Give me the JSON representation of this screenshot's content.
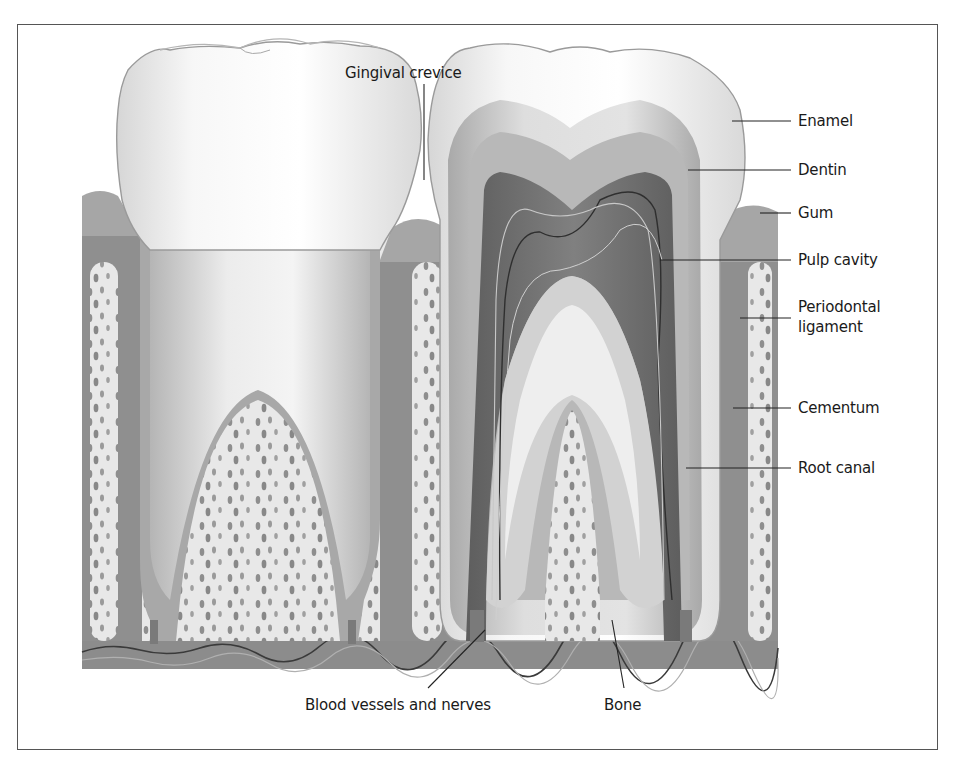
{
  "figure": {
    "title_label": "Gingival crevice",
    "right_labels": [
      {
        "id": "enamel",
        "text": "Enamel"
      },
      {
        "id": "dentin",
        "text": "Dentin"
      },
      {
        "id": "gum",
        "text": "Gum"
      },
      {
        "id": "pulp-cavity",
        "text": "Pulp cavity"
      },
      {
        "id": "periodontal-ligament",
        "text": "Periodontal",
        "text2": "ligament"
      },
      {
        "id": "cementum",
        "text": "Cementum"
      },
      {
        "id": "root-canal",
        "text": "Root canal"
      }
    ],
    "bottom_labels": [
      {
        "id": "blood-vessels-and-nerves",
        "text": "Blood vessels and nerves"
      },
      {
        "id": "bone",
        "text": "Bone"
      }
    ],
    "colors": {
      "frame": "#555555",
      "enamel": "#f4f4f4",
      "dentin": "#c8c8c8",
      "pulp": "#6e6e6e",
      "gum": "#9a9a9a",
      "bone": "#e6e6e6",
      "bone_pores": "#8c8c8c",
      "base": "#8a8a8a",
      "leader": "#222222"
    }
  }
}
